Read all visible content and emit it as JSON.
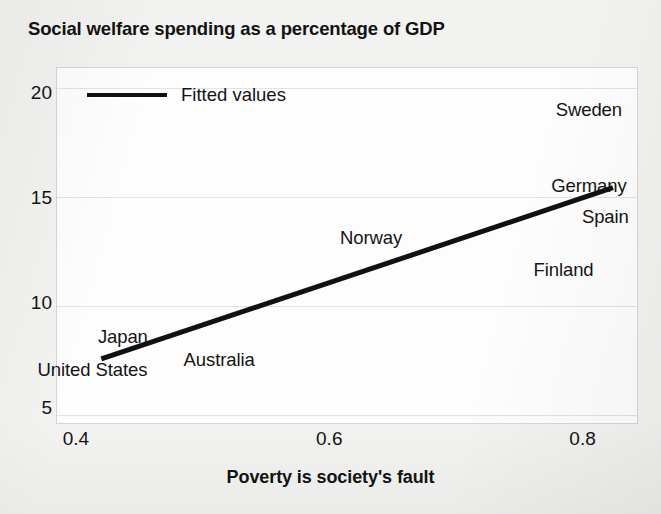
{
  "title": "Social welfare spending as a percentage of GDP",
  "legend": {
    "label": "Fitted values"
  },
  "chart_data": {
    "type": "scatter",
    "title": "Social welfare spending as a percentage of GDP",
    "xlabel": "Poverty is society's fault",
    "ylabel": "",
    "xlim": [
      0.385,
      0.843
    ],
    "ylim": [
      4.3,
      21.2
    ],
    "xticks": [
      0.4,
      0.6,
      0.8
    ],
    "xtick_labels": [
      "0.4",
      "0.6",
      "0.8"
    ],
    "yticks": [
      5,
      10,
      15,
      20
    ],
    "ytick_labels": [
      "5",
      "10",
      "15",
      "20"
    ],
    "grid": true,
    "legend_position": "top-left",
    "marker_style": "text-label",
    "points": [
      {
        "label": "Sweden",
        "x": 0.805,
        "y": 19.2
      },
      {
        "label": "Germany",
        "x": 0.805,
        "y": 15.6
      },
      {
        "label": "Spain",
        "x": 0.818,
        "y": 14.1
      },
      {
        "label": "Finland",
        "x": 0.785,
        "y": 11.6
      },
      {
        "label": "Norway",
        "x": 0.633,
        "y": 13.1
      },
      {
        "label": "Japan",
        "x": 0.437,
        "y": 8.4
      },
      {
        "label": "Australia",
        "x": 0.513,
        "y": 7.3
      },
      {
        "label": "United States",
        "x": 0.413,
        "y": 6.8
      }
    ],
    "series": [
      {
        "name": "Fitted values",
        "type": "line",
        "x": [
          0.42,
          0.824
        ],
        "y": [
          7.35,
          15.5
        ]
      }
    ]
  }
}
